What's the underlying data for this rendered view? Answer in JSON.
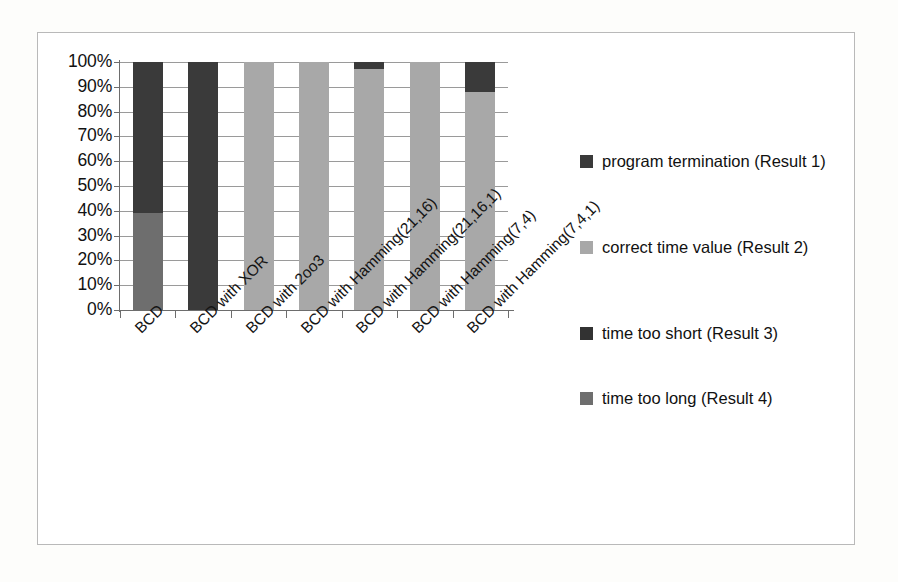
{
  "figure": {
    "frame_border_color": "#b9b9b9",
    "page_background": "#fdfdfb",
    "plot_background": "#ffffff"
  },
  "chart_data": {
    "type": "bar",
    "subtype": "100% stacked column",
    "title": "",
    "subtitle": "",
    "xlabel": "",
    "ylabel": "",
    "ylim": [
      0,
      100
    ],
    "y_unit": "%",
    "grid": true,
    "legend_position": "right",
    "categories": [
      "BCD",
      "BCD with XOR",
      "BCD with 2oo3",
      "BCD with Hamming(21,16)",
      "BCD with Hamming(21,16,1)",
      "BCD with Hamming(7,4)",
      "BCD with Hamming(7,4,1)"
    ],
    "y_ticks": [
      "0%",
      "10%",
      "20%",
      "30%",
      "40%",
      "50%",
      "60%",
      "70%",
      "80%",
      "90%",
      "100%"
    ],
    "y_tick_values": [
      0,
      10,
      20,
      30,
      40,
      50,
      60,
      70,
      80,
      90,
      100
    ],
    "series": [
      {
        "name": "program termination (Result 1)",
        "color": "#3a3a3a",
        "values": [
          61,
          100,
          0,
          0,
          3,
          0,
          12
        ]
      },
      {
        "name": "correct time value (Result 2)",
        "color": "#a8a8a8",
        "values": [
          0,
          0,
          100,
          100,
          97,
          100,
          88
        ]
      },
      {
        "name": "time too short (Result 3)",
        "color": "#323232",
        "values": [
          0,
          0,
          0,
          0,
          0,
          0,
          0
        ]
      },
      {
        "name": "time too long (Result 4)",
        "color": "#6e6e6e",
        "values": [
          39,
          0,
          0,
          0,
          0,
          0,
          0
        ]
      }
    ],
    "bars": [
      {
        "category": "BCD",
        "segments": [
          {
            "series": "time too long (Result 4)",
            "from": 0,
            "to": 39,
            "color": "#6e6e6e"
          },
          {
            "series": "program termination (Result 1)",
            "from": 39,
            "to": 100,
            "color": "#3a3a3a"
          }
        ]
      },
      {
        "category": "BCD with XOR",
        "segments": [
          {
            "series": "program termination (Result 1)",
            "from": 0,
            "to": 100,
            "color": "#3a3a3a"
          }
        ]
      },
      {
        "category": "BCD with 2oo3",
        "segments": [
          {
            "series": "correct time value (Result 2)",
            "from": 0,
            "to": 100,
            "color": "#a8a8a8"
          }
        ]
      },
      {
        "category": "BCD with Hamming(21,16)",
        "segments": [
          {
            "series": "correct time value (Result 2)",
            "from": 0,
            "to": 100,
            "color": "#a8a8a8"
          }
        ]
      },
      {
        "category": "BCD with Hamming(21,16,1)",
        "segments": [
          {
            "series": "correct time value (Result 2)",
            "from": 0,
            "to": 97,
            "color": "#a8a8a8"
          },
          {
            "series": "program termination (Result 1)",
            "from": 97,
            "to": 100,
            "color": "#3a3a3a"
          }
        ]
      },
      {
        "category": "BCD with Hamming(7,4)",
        "segments": [
          {
            "series": "correct time value (Result 2)",
            "from": 0,
            "to": 100,
            "color": "#a8a8a8"
          }
        ]
      },
      {
        "category": "BCD with Hamming(7,4,1)",
        "segments": [
          {
            "series": "correct time value (Result 2)",
            "from": 0,
            "to": 88,
            "color": "#a8a8a8"
          },
          {
            "series": "program termination (Result 1)",
            "from": 88,
            "to": 100,
            "color": "#3a3a3a"
          }
        ]
      }
    ]
  },
  "legend": {
    "items": [
      {
        "label": "program termination (Result 1)",
        "color": "#3a3a3a"
      },
      {
        "label": "correct time value (Result 2)",
        "color": "#a8a8a8"
      },
      {
        "label": "time too short (Result 3)",
        "color": "#323232"
      },
      {
        "label": "time too long (Result 4)",
        "color": "#6e6e6e"
      }
    ]
  }
}
